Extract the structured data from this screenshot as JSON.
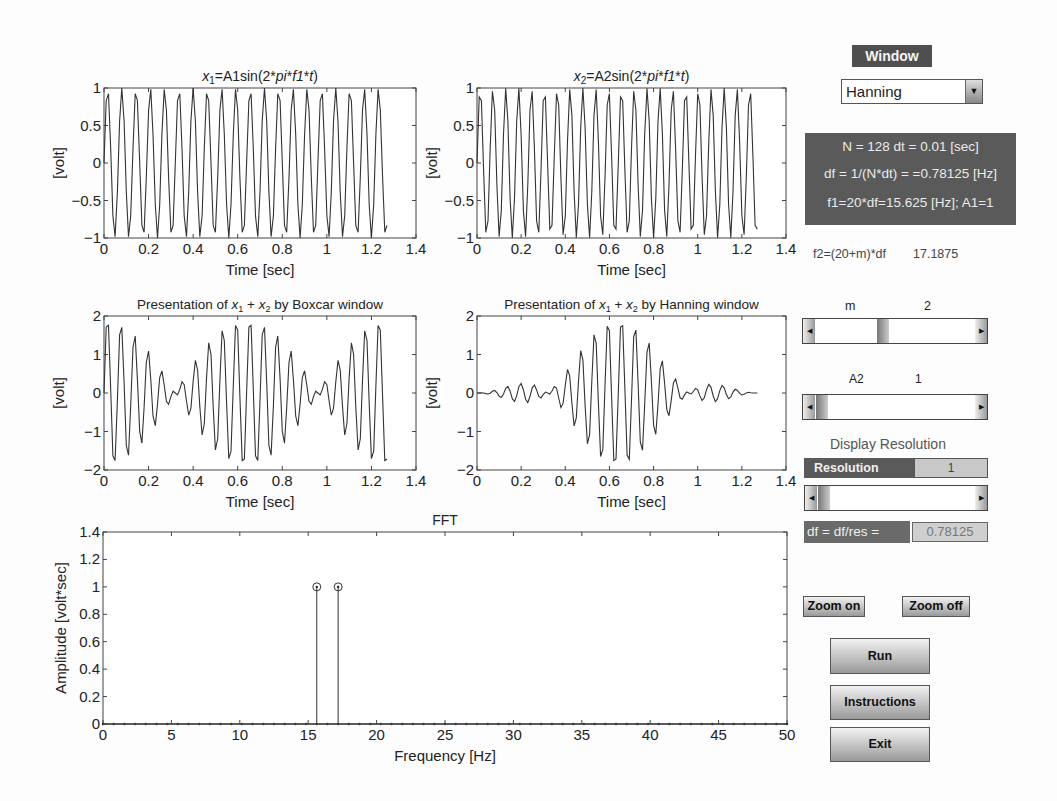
{
  "controls": {
    "window_label": "Window",
    "window_select": {
      "selected": "Hanning"
    },
    "info": {
      "line1": "N = 128 dt = 0.01 [sec]",
      "line2": "df = 1/(N*dt) = =0.78125 [Hz]",
      "line3": "f1=20*df=15.625 [Hz]; A1=1"
    },
    "f2_label": "f2=(20+m)*df",
    "f2_value": "17.1875",
    "m_label": "m",
    "m_value": "2",
    "a2_label": "A2",
    "a2_value": "1",
    "display_resolution_title": "Display Resolution",
    "resolution_label": "Resolution",
    "resolution_value": "1",
    "df_res_label": "df = df/res =",
    "df_res_value": "0.78125",
    "zoom_on": "Zoom on",
    "zoom_off": "Zoom off",
    "run": "Run",
    "instructions": "Instructions",
    "exit": "Exit"
  },
  "chart_data": [
    {
      "type": "line",
      "title": "x1=A1sin(2*pi*f1*t)",
      "xlabel": "Time [sec]",
      "ylabel": "[volt]",
      "xlim": [
        0,
        1.4
      ],
      "ylim": [
        -1,
        1
      ],
      "xticks": [
        "0",
        "0.2",
        "0.4",
        "0.6",
        "0.8",
        "1",
        "1.2",
        "1.4"
      ],
      "yticks": [
        "-1",
        "-0.5",
        "0",
        "0.5",
        "1"
      ],
      "signal": {
        "amplitude": 1,
        "frequency_hz": 15.625,
        "dt": 0.01,
        "n": 128,
        "window": "none"
      }
    },
    {
      "type": "line",
      "title": "x2=A2sin(2*pi*f1*t)",
      "xlabel": "Time [sec]",
      "ylabel": "[volt]",
      "xlim": [
        0,
        1.4
      ],
      "ylim": [
        -1,
        1
      ],
      "xticks": [
        "0",
        "0.2",
        "0.4",
        "0.6",
        "0.8",
        "1",
        "1.2",
        "1.4"
      ],
      "yticks": [
        "-1",
        "-0.5",
        "0",
        "0.5",
        "1"
      ],
      "signal": {
        "amplitude": 1,
        "frequency_hz": 17.1875,
        "dt": 0.01,
        "n": 128,
        "window": "none"
      }
    },
    {
      "type": "line",
      "title": "Presentation of x1 + x2 by Boxcar window",
      "xlabel": "Time [sec]",
      "ylabel": "[volt]",
      "xlim": [
        0,
        1.4
      ],
      "ylim": [
        -2,
        2
      ],
      "xticks": [
        "0",
        "0.2",
        "0.4",
        "0.6",
        "0.8",
        "1",
        "1.2",
        "1.4"
      ],
      "yticks": [
        "-2",
        "-1",
        "0",
        "1",
        "2"
      ],
      "signal": {
        "sum_of": [
          15.625,
          17.1875
        ],
        "dt": 0.01,
        "n": 128,
        "window": "boxcar"
      }
    },
    {
      "type": "line",
      "title": "Presentation of x1 + x2 by Hanning window",
      "xlabel": "Time [sec]",
      "ylabel": "[volt]",
      "xlim": [
        0,
        1.4
      ],
      "ylim": [
        -2,
        2
      ],
      "xticks": [
        "0",
        "0.2",
        "0.4",
        "0.6",
        "0.8",
        "1",
        "1.2",
        "1.4"
      ],
      "yticks": [
        "-2",
        "-1",
        "0",
        "1",
        "2"
      ],
      "signal": {
        "sum_of": [
          15.625,
          17.1875
        ],
        "dt": 0.01,
        "n": 128,
        "window": "hanning"
      }
    },
    {
      "type": "stem",
      "title": "FFT",
      "xlabel": "Frequency [Hz]",
      "ylabel": "Amplitude [volt*sec]",
      "xlim": [
        0,
        50
      ],
      "ylim": [
        0,
        1.4
      ],
      "xticks": [
        "0",
        "5",
        "10",
        "15",
        "20",
        "25",
        "30",
        "35",
        "40",
        "45",
        "50"
      ],
      "yticks": [
        "0",
        "0.2",
        "0.4",
        "0.6",
        "0.8",
        "1",
        "1.2",
        "1.4"
      ],
      "df": 0.78125,
      "peaks": [
        {
          "x": 15.625,
          "y": 1
        },
        {
          "x": 17.1875,
          "y": 1
        }
      ],
      "baseline": 0
    }
  ]
}
